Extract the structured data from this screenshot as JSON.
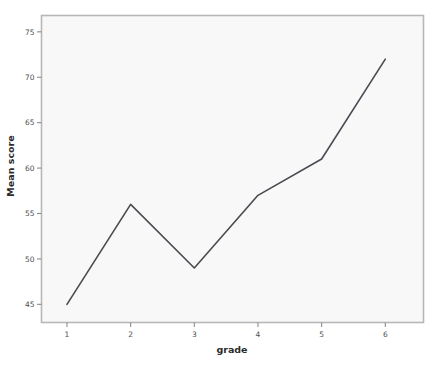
{
  "chart_data": {
    "type": "line",
    "title": "",
    "xlabel": "grade",
    "ylabel": "Mean score",
    "x": [
      1,
      2,
      3,
      4,
      5,
      6
    ],
    "categories": [
      "1",
      "2",
      "3",
      "4",
      "5",
      "6"
    ],
    "values": [
      45,
      56,
      49,
      57,
      61,
      72
    ],
    "series": [
      {
        "name": "Mean score",
        "values": [
          45,
          56,
          49,
          57,
          61,
          72
        ]
      }
    ],
    "xlim": [
      0.6,
      6.6
    ],
    "ylim": [
      43.0,
      76.8
    ],
    "xticks": [
      "1",
      "2",
      "3",
      "4",
      "5",
      "6"
    ],
    "yticks": [
      "45",
      "50",
      "55",
      "60",
      "65",
      "70",
      "75"
    ],
    "ytick_values": [
      45,
      50,
      55,
      60,
      65,
      70,
      75
    ],
    "grid": false,
    "legend": "none",
    "markers": "none",
    "line_color": "#4a4a52",
    "plot_background": "#f8f8f8",
    "page_background": "#ffffff",
    "frame_color": "#b7b7b7"
  },
  "axes": {
    "y_axis": {
      "title": "Mean score",
      "tick_labels": [
        "75",
        "70",
        "65",
        "60",
        "55",
        "50",
        "45"
      ]
    },
    "x_axis": {
      "title": "grade",
      "tick_labels": [
        "1",
        "2",
        "3",
        "4",
        "5",
        "6"
      ]
    }
  }
}
